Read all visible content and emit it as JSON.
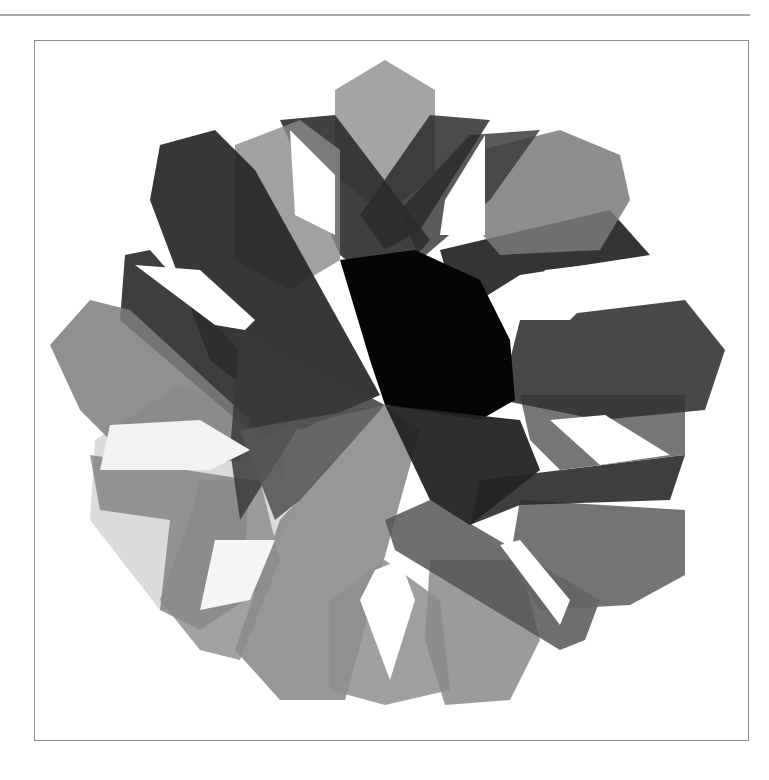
{
  "page": {
    "top_rule": {
      "color": "#a8a8a8"
    },
    "frame": {
      "border_color": "#8c8c8c"
    }
  },
  "figure": {
    "center": [
      385,
      405
    ],
    "shapes": [
      {
        "name": "band-bottom-left-light",
        "fill": "#bdbdbd",
        "opacity": 0.55,
        "points": "90,520 95,440 180,385 280,420 290,520 250,600 160,610"
      },
      {
        "name": "band-left-lower",
        "fill": "#7a7a7a",
        "opacity": 0.75,
        "points": "90,455 250,480 245,545 260,590 200,630 160,610 170,520 100,510"
      },
      {
        "name": "band-bottom-left-vertical",
        "fill": "#8a8a8a",
        "opacity": 0.8,
        "points": "200,480 260,480 280,560 240,660 200,650 160,600 190,520"
      },
      {
        "name": "band-bottom-center-left",
        "fill": "#8c8c8c",
        "opacity": 0.9,
        "points": "280,520 385,405 420,430 345,700 280,700 235,650"
      },
      {
        "name": "band-bottom-center",
        "fill": "#8e8e8e",
        "opacity": 0.85,
        "points": "330,600 385,560 440,600 450,690 385,705 330,690"
      },
      {
        "name": "band-bottom-right-vertical",
        "fill": "#8a8a8a",
        "opacity": 0.85,
        "points": "430,560 520,560 540,640 510,700 445,705 425,640"
      },
      {
        "name": "band-bottom-right-diagonal",
        "fill": "#555555",
        "opacity": 0.85,
        "points": "385,520 395,550 560,650 585,640 600,600 430,500"
      },
      {
        "name": "band-right-hex-lower",
        "fill": "#656565",
        "opacity": 0.9,
        "points": "520,500 685,510 685,575 630,605 540,610 510,560"
      },
      {
        "name": "band-right-mid",
        "fill": "#2a2a2a",
        "opacity": 0.9,
        "points": "480,480 685,455 670,500 520,505 470,525"
      },
      {
        "name": "band-right-upper-mid",
        "fill": "#5e5e5e",
        "opacity": 0.85,
        "points": "520,395 685,395 685,455 560,470 530,440"
      },
      {
        "name": "band-right-hex-upper",
        "fill": "#343434",
        "opacity": 0.9,
        "points": "520,320 685,300 725,350 705,410 600,420 500,400"
      },
      {
        "name": "band-right-top-diagonal",
        "fill": "#1e1e1e",
        "opacity": 0.9,
        "points": "440,250 610,210 650,255 520,275 480,300 450,285"
      },
      {
        "name": "band-top-right-vertical",
        "fill": "#7a7a7a",
        "opacity": 0.85,
        "points": "480,150 560,130 620,155 630,200 600,250 500,255 470,220"
      },
      {
        "name": "band-top-right-diagonal",
        "fill": "#3d3d3d",
        "opacity": 0.85,
        "points": "400,210 470,135 540,130 490,200 420,260"
      },
      {
        "name": "band-top-center-hex",
        "fill": "#9a9a9a",
        "opacity": 0.9,
        "points": "335,90 385,60 435,90 435,175 385,215 335,175"
      },
      {
        "name": "band-top-left-diagonal",
        "fill": "#2c2c2c",
        "opacity": 0.9,
        "points": "280,120 335,115 430,240 385,290 340,255"
      },
      {
        "name": "band-top-right-crossing",
        "fill": "#2c2c2c",
        "opacity": 0.85,
        "points": "430,115 490,120 420,230 385,250 360,215"
      },
      {
        "name": "band-top-left-vertical",
        "fill": "#8a8a8a",
        "opacity": 0.8,
        "points": "235,145 300,120 340,150 340,260 290,290 235,260"
      },
      {
        "name": "band-top-left-hex",
        "fill": "#262626",
        "opacity": 0.92,
        "points": "160,145 215,130 255,170 380,395 300,430 210,360 150,200"
      },
      {
        "name": "band-left-upper",
        "fill": "#2e2e2e",
        "opacity": 0.92,
        "points": "125,255 150,250 300,420 260,440 120,320"
      },
      {
        "name": "band-left-hex",
        "fill": "#7c7c7c",
        "opacity": 0.85,
        "points": "50,345 90,300 130,310 250,420 240,460 140,470 80,410"
      },
      {
        "name": "band-left-lower-dark",
        "fill": "#3a3a3a",
        "opacity": 0.85,
        "points": "240,330 385,405 300,425 240,520 230,450"
      },
      {
        "name": "center-core",
        "fill": "#050505",
        "opacity": 1.0,
        "points": "340,260 415,250 480,280 510,340 515,400 480,420 385,405 370,360"
      },
      {
        "name": "center-lower-right-dark",
        "fill": "#232323",
        "opacity": 0.95,
        "points": "385,405 520,420 540,470 470,525 430,500"
      },
      {
        "name": "center-lower-left-wedge",
        "fill": "#555555",
        "opacity": 0.9,
        "points": "240,430 385,405 300,500 275,520"
      },
      {
        "name": "window-top-left-white",
        "fill": "#ffffff",
        "opacity": 1.0,
        "points": "290,130 335,175 335,235 295,215"
      },
      {
        "name": "window-top-right-white",
        "fill": "#ffffff",
        "opacity": 1.0,
        "points": "485,135 485,235 440,235 445,200"
      },
      {
        "name": "window-left-white",
        "fill": "#ffffff",
        "opacity": 1.0,
        "points": "135,265 200,270 255,320 245,330 215,325"
      },
      {
        "name": "window-right-top-white",
        "fill": "#ffffff",
        "opacity": 1.0,
        "points": "545,270 630,260 570,320 520,320"
      },
      {
        "name": "window-right-mid-white",
        "fill": "#ffffff",
        "opacity": 1.0,
        "points": "550,420 605,415 670,455 600,465"
      },
      {
        "name": "window-left-mid-white",
        "fill": "#f2f2f2",
        "opacity": 1.0,
        "points": "110,425 200,420 250,450 210,470 100,470"
      },
      {
        "name": "window-bottom-white",
        "fill": "#ffffff",
        "opacity": 1.0,
        "points": "375,570 400,560 415,600 390,680 360,600"
      },
      {
        "name": "window-bottom-right-white",
        "fill": "#ffffff",
        "opacity": 1.0,
        "points": "500,545 520,540 570,600 560,625"
      },
      {
        "name": "window-bottom-left-white",
        "fill": "#f5f5f5",
        "opacity": 1.0,
        "points": "215,540 275,540 250,600 200,610"
      }
    ]
  }
}
